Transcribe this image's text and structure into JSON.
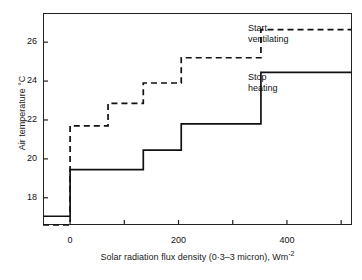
{
  "chart_data": {
    "type": "line",
    "title": "",
    "xlabel": "Solar radiation flux density (0·3–3 micron), Wm",
    "xlabel_sup": "-2",
    "ylabel": "Air temperature °C",
    "xlim": [
      -50,
      520
    ],
    "ylim": [
      16.6,
      27.5
    ],
    "xticks": [
      0,
      100,
      200,
      300,
      400,
      500
    ],
    "xticklabels": [
      "0",
      "",
      "200",
      "",
      "400",
      ""
    ],
    "yticks": [
      18,
      20,
      22,
      24,
      26
    ],
    "yticklabels": [
      "18",
      "20",
      "22",
      "24",
      "26"
    ],
    "grid": false,
    "legend": "none",
    "series": [
      {
        "name": "Stop heating",
        "style": "solid",
        "color": "#111111",
        "steps": [
          {
            "x": -50,
            "y": 17.05
          },
          {
            "x": 0,
            "y": 19.45
          },
          {
            "x": 135,
            "y": 20.45
          },
          {
            "x": 205,
            "y": 21.8
          },
          {
            "x": 352,
            "y": 24.45
          },
          {
            "x": 520,
            "y": 24.45
          }
        ]
      },
      {
        "name": "Start ventilating",
        "style": "dashed",
        "color": "#111111",
        "steps": [
          {
            "x": -50,
            "y": 16.6
          },
          {
            "x": 0,
            "y": 21.7
          },
          {
            "x": 70,
            "y": 22.85
          },
          {
            "x": 135,
            "y": 23.9
          },
          {
            "x": 205,
            "y": 25.2
          },
          {
            "x": 352,
            "y": 26.65
          },
          {
            "x": 520,
            "y": 26.65
          }
        ]
      }
    ],
    "annotations": [
      {
        "name": "start-ventilating",
        "line1": "Start",
        "line2": "ventilating"
      },
      {
        "name": "stop-heating",
        "line1": "Stop",
        "line2": "heating"
      }
    ]
  }
}
